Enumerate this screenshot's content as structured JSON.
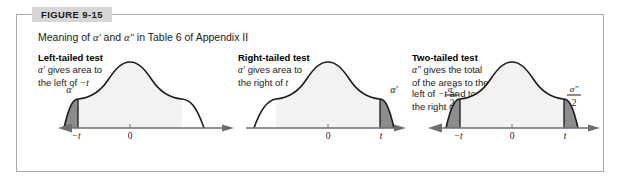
{
  "figure": {
    "tab_label": "FIGURE 9-15",
    "caption_prefix": "Meaning of ",
    "caption_alpha1": "α′",
    "caption_and": " and ",
    "caption_alpha2": "α″",
    "caption_suffix": " in Table 6 of Appendix II"
  },
  "panels": [
    {
      "title": "Left-tailed test",
      "desc_line1_alpha": "α′",
      "desc_line1_rest": " gives area to",
      "desc_line2": "the left of ",
      "desc_line2_sym": "−t",
      "tail_label": "α′",
      "axis_ticks": [
        "−t",
        "0"
      ],
      "shaded_side": "left"
    },
    {
      "title": "Right-tailed test",
      "desc_line1_alpha": "α′",
      "desc_line1_rest": " gives area to",
      "desc_line2": "the right of ",
      "desc_line2_sym": "t",
      "tail_label": "α′",
      "axis_ticks": [
        "0",
        "t"
      ],
      "shaded_side": "right"
    },
    {
      "title": "Two-tailed test",
      "desc_line1_alpha": "α″",
      "desc_line1_rest": " gives the total",
      "desc_line2": "of the areas to the",
      "desc_line3": "left of ",
      "desc_line3_sym": "−t",
      "desc_line3_rest": " and to",
      "desc_line4": "the right of ",
      "desc_line4_sym": "t",
      "tail_label_numerator": "α″",
      "tail_label_denominator": "2",
      "axis_ticks": [
        "−t",
        "0",
        "t"
      ],
      "shaded_side": "both"
    }
  ],
  "colors": {
    "border": "#a8a8a8",
    "tab_background": "#d6d6d6",
    "curve_stroke": "#1a1a1a",
    "shade_fill": "#8c8c8c",
    "axis": "#6e6e6e",
    "text": "#1a1a1a"
  }
}
